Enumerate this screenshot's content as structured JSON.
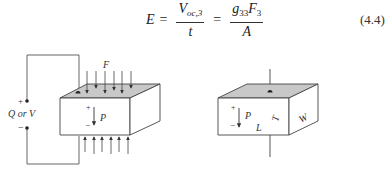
{
  "equation": {
    "lhs": "E",
    "equals": "=",
    "frac1": {
      "num_main": "V",
      "num_sub": "oc,3",
      "den": "t"
    },
    "frac2": {
      "num_g": "g",
      "num_g_sub": "33",
      "num_F": "F",
      "num_F_sub": "3",
      "den": "A"
    },
    "number": "(4.4)"
  },
  "figure_left": {
    "force_label": "F",
    "polarization_label": "P",
    "plus": "+",
    "minus": "−",
    "terminal_plus": "+",
    "terminal_minus": "−",
    "terminal_label": "Q or V",
    "top_face_color": "#c8c8c8",
    "line_color": "#444444"
  },
  "figure_right": {
    "polarization_label": "P",
    "plus": "+",
    "minus": "−",
    "length_label": "L",
    "thickness_label": "T",
    "width_label": "W",
    "top_face_color": "#c8c8c8",
    "line_color": "#444444"
  }
}
